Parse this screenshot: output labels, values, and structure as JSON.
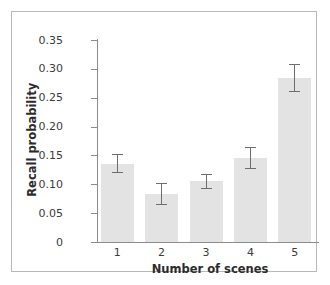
{
  "chart_data": {
    "type": "bar",
    "title": "",
    "xlabel": "Number of scenes",
    "ylabel": "Recall probability",
    "categories": [
      "1",
      "2",
      "3",
      "4",
      "5"
    ],
    "values": [
      0.136,
      0.083,
      0.105,
      0.145,
      0.284
    ],
    "errors": [
      0.016,
      0.019,
      0.013,
      0.019,
      0.024
    ],
    "error_upper": [
      0.152,
      0.102,
      0.118,
      0.164,
      0.308
    ],
    "error_lower": [
      0.12,
      0.064,
      0.092,
      0.126,
      0.26
    ],
    "ylim": [
      0,
      0.35
    ],
    "ytick_values": [
      0,
      0.05,
      0.1,
      0.15,
      0.2,
      0.25,
      0.3,
      0.35
    ],
    "ytick_labels": [
      "0",
      "0.05",
      "0.10",
      "0.15",
      "0.20",
      "0.25",
      "0.30",
      "0.35"
    ],
    "grid": false,
    "legend": false,
    "bar_color": "#e3e3e3",
    "error_color": "#6d6d6d",
    "axis_color": "#8c8c8c",
    "background": "#ffffff"
  }
}
